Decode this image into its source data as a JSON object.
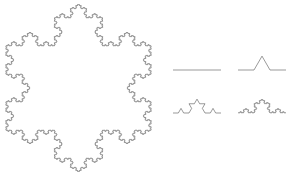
{
  "figure": {
    "background_color": "#ffffff",
    "stroke_color": "#555555",
    "stroke_width": 0.6,
    "width": 287,
    "height": 179
  },
  "chart_data": {
    "type": "line",
    "xlabel": "",
    "ylabel": "",
    "grid": false,
    "legend": "none",
    "xlim": [
      0,
      287
    ],
    "ylim": [
      179,
      0
    ],
    "series": [
      {
        "name": "koch-snowflake",
        "shape": "snowflake",
        "iterations": 5,
        "closed": true,
        "center": [
          78.5,
          88.0
        ],
        "radius": 84.0,
        "top_vertex": [
          78.5,
          4.0
        ],
        "bottom_vertex": [
          78.5,
          172.0
        ],
        "left_extent": 7.0,
        "right_extent": 150.0,
        "orientation_deg": -90
      },
      {
        "name": "koch-curve-stage-0",
        "shape": "curve",
        "iterations": 0,
        "closed": false,
        "start": [
          173.0,
          70.0
        ],
        "end": [
          221.0,
          70.0
        ],
        "segment_length": 48.0
      },
      {
        "name": "koch-curve-stage-1",
        "shape": "curve",
        "iterations": 1,
        "closed": false,
        "start": [
          238.0,
          70.0
        ],
        "end": [
          286.0,
          70.0
        ],
        "segment_length": 48.0
      },
      {
        "name": "koch-curve-stage-2",
        "shape": "curve",
        "iterations": 2,
        "closed": false,
        "start": [
          173.0,
          113.0
        ],
        "end": [
          221.0,
          113.0
        ],
        "segment_length": 48.0
      },
      {
        "name": "koch-curve-stage-3",
        "shape": "curve",
        "iterations": 4,
        "closed": false,
        "start": [
          238.0,
          113.0
        ],
        "end": [
          286.0,
          113.0
        ],
        "segment_length": 48.0
      }
    ]
  }
}
